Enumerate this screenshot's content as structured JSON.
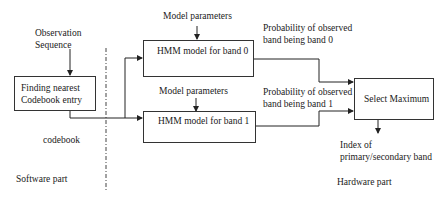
{
  "diagram": {
    "nodes": {
      "codebook_finder": {
        "line1": "Finding nearest",
        "line2": "Codebook entry"
      },
      "hmm_band0": {
        "label": "HMM model for band 0"
      },
      "hmm_band1": {
        "label": "HMM model for band 1"
      },
      "select_max": {
        "label": "Select Maximum"
      }
    },
    "labels": {
      "observation_line1": "Observation",
      "observation_line2": "Sequence",
      "model_params_0": "Model parameters",
      "model_params_1": "Model parameters",
      "prob_band0_line1": "Probability of observed",
      "prob_band0_line2": "band being band 0",
      "prob_band1_line1": "Probability of observed",
      "prob_band1_line2": "band being band 1",
      "codebook": "codebook",
      "index_line1": "Index of",
      "index_line2": "primary/secondary band",
      "software_part": "Software part",
      "hardware_part": "Hardware part"
    },
    "edges": [
      {
        "from": "observation-sequence",
        "to": "codebook_finder"
      },
      {
        "from": "codebook_finder",
        "to": "hmm_band0"
      },
      {
        "from": "codebook_finder",
        "to": "hmm_band1"
      },
      {
        "from": "model-parameters-0",
        "to": "hmm_band0"
      },
      {
        "from": "model-parameters-1",
        "to": "hmm_band1"
      },
      {
        "from": "hmm_band0",
        "to": "select_max"
      },
      {
        "from": "hmm_band1",
        "to": "select_max"
      },
      {
        "from": "select_max",
        "to": "index-output"
      }
    ],
    "partition": {
      "left": "Software part",
      "right": "Hardware part",
      "style": "dash-dot"
    }
  }
}
